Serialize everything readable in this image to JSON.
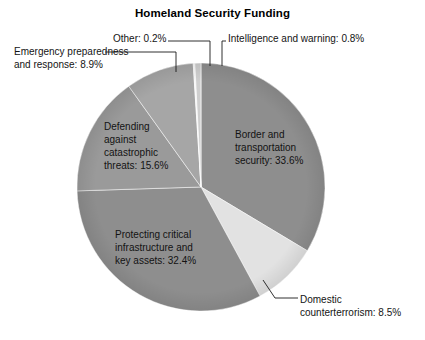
{
  "chart_data": {
    "type": "pie",
    "title": "Homeland Security Funding",
    "xlabel": "",
    "ylabel": "",
    "legend_position": "none",
    "grid": false,
    "labels_inside": true,
    "unit": "%",
    "categories": [
      "Border and transportation security",
      "Domestic counterterrorism",
      "Protecting critical infrastructure and key assets",
      "Defending against catastrophic threats",
      "Emergency preparedness and response",
      "Other",
      "Intelligence and warning"
    ],
    "values": [
      33.6,
      8.5,
      32.4,
      15.6,
      8.9,
      0.2,
      0.8
    ],
    "slices": [
      {
        "name": "Border and transportation security",
        "label": "Border and transportation security: 33.6%",
        "label_lines": [
          "Border and",
          "transportation",
          "security: 33.6%"
        ],
        "value": 33.6,
        "color": "#8e8e8e",
        "label_placement": "inside"
      },
      {
        "name": "Domestic counterterrorism",
        "label": "Domestic counterterrorism: 8.5%",
        "label_lines": [
          "Domestic",
          "counterterrorism: 8.5%"
        ],
        "value": 8.5,
        "color": "#e2e2e2",
        "label_placement": "callout"
      },
      {
        "name": "Protecting critical infrastructure and key assets",
        "label": "Protecting critical infrastructure and key assets: 32.4%",
        "label_lines": [
          "Protecting critical",
          "infrastructure and",
          "key assets: 32.4%"
        ],
        "value": 32.4,
        "color": "#8e8e8e",
        "label_placement": "inside"
      },
      {
        "name": "Defending against catastrophic threats",
        "label": "Defending against catastrophic threats: 15.6%",
        "label_lines": [
          "Defending",
          "against",
          "catastrophic",
          "threats: 15.6%"
        ],
        "value": 15.6,
        "color": "#9a9a9a",
        "label_placement": "inside"
      },
      {
        "name": "Emergency preparedness and response",
        "label": "Emergency preparedness and response: 8.9%",
        "label_lines": [
          "Emergency preparedness",
          "and response: 8.9%"
        ],
        "value": 8.9,
        "color": "#a6a6a6",
        "label_placement": "callout"
      },
      {
        "name": "Other",
        "label": "Other: 0.2%",
        "label_lines": [
          "Other: 0.2%"
        ],
        "value": 0.2,
        "color": "#f2f2f2",
        "label_placement": "callout"
      },
      {
        "name": "Intelligence and warning",
        "label": "Intelligence and warning: 0.8%",
        "label_lines": [
          "Intelligence and warning: 0.8%"
        ],
        "value": 0.8,
        "color": "#cfcfcf",
        "label_placement": "callout"
      }
    ],
    "colors": {
      "background": "#ffffff",
      "primary_gray": "#8e8e8e",
      "secondary_gray": "#9a9a9a",
      "tertiary_gray": "#a6a6a6",
      "light_slice": "#e2e2e2",
      "leader_line": "#1a1a1a",
      "text": "#141414"
    }
  },
  "labels": {
    "title": "Homeland Security Funding",
    "emergency_line1": "Emergency preparedness",
    "emergency_line2": "and response: 8.9%",
    "other": "Other: 0.2%",
    "intelligence": "Intelligence and warning: 0.8%",
    "domestic_line1": "Domestic",
    "domestic_line2": "counterterrorism: 8.5%",
    "defending_line1": "Defending",
    "defending_line2": "against",
    "defending_line3": "catastrophic",
    "defending_line4": "threats: 15.6%",
    "border_line1": "Border and",
    "border_line2": "transportation",
    "border_line3": "security: 33.6%",
    "protecting_line1": "Protecting critical",
    "protecting_line2": "infrastructure and",
    "protecting_line3": "key assets: 32.4%"
  }
}
